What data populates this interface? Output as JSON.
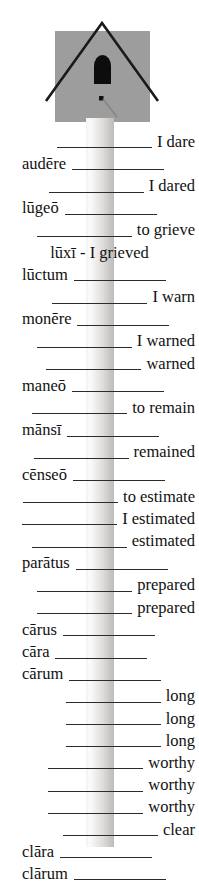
{
  "illustration": {
    "name": "birdhouse-on-post",
    "house_color": "#9d9d9d",
    "roof_line_color": "#1a1a1a",
    "hole_color": "#0d0d0d",
    "post_color": "#e8e7e5"
  },
  "worksheet": {
    "title": "Latin verb and adjective principal parts practice",
    "rows": [
      {
        "align": "right",
        "blank": true,
        "word": "",
        "answer": "I dare"
      },
      {
        "align": "left",
        "blank": true,
        "word": "audēre",
        "answer": ""
      },
      {
        "align": "right",
        "blank": true,
        "word": "",
        "answer": "I dared"
      },
      {
        "align": "left",
        "blank": true,
        "word": "lūgeō",
        "answer": ""
      },
      {
        "align": "right",
        "blank": true,
        "word": "",
        "answer": "to grieve"
      },
      {
        "align": "center",
        "blank": false,
        "word": "lūxī - I grieved",
        "answer": ""
      },
      {
        "align": "left",
        "blank": true,
        "word": "lūctum",
        "answer": ""
      },
      {
        "align": "right",
        "blank": true,
        "word": "",
        "answer": "I warn"
      },
      {
        "align": "left",
        "blank": true,
        "word": "monēre",
        "answer": ""
      },
      {
        "align": "right",
        "blank": true,
        "word": "",
        "answer": "I warned"
      },
      {
        "align": "right",
        "blank": true,
        "word": "",
        "answer": "warned"
      },
      {
        "align": "left",
        "blank": true,
        "word": "maneō",
        "answer": ""
      },
      {
        "align": "right",
        "blank": true,
        "word": "",
        "answer": "to remain"
      },
      {
        "align": "left",
        "blank": true,
        "word": "mānsī",
        "answer": ""
      },
      {
        "align": "right",
        "blank": true,
        "word": "",
        "answer": "remained"
      },
      {
        "align": "left",
        "blank": true,
        "word": "cēnseō",
        "answer": ""
      },
      {
        "align": "right",
        "blank": true,
        "word": "",
        "answer": "to estimate"
      },
      {
        "align": "right",
        "blank": true,
        "word": "",
        "answer": "I estimated"
      },
      {
        "align": "right",
        "blank": true,
        "word": "",
        "answer": "estimated"
      },
      {
        "align": "left",
        "blank": true,
        "word": "parātus",
        "answer": ""
      },
      {
        "align": "right",
        "blank": true,
        "word": "",
        "answer": "prepared"
      },
      {
        "align": "right",
        "blank": true,
        "word": "",
        "answer": "prepared"
      },
      {
        "align": "left",
        "blank": true,
        "word": "cārus",
        "answer": ""
      },
      {
        "align": "left",
        "blank": true,
        "word": "cāra",
        "answer": ""
      },
      {
        "align": "left",
        "blank": true,
        "word": "cārum",
        "answer": ""
      },
      {
        "align": "right",
        "blank": true,
        "word": "",
        "answer": "long"
      },
      {
        "align": "right",
        "blank": true,
        "word": "",
        "answer": "long"
      },
      {
        "align": "right",
        "blank": true,
        "word": "",
        "answer": "long"
      },
      {
        "align": "right",
        "blank": true,
        "word": "",
        "answer": "worthy"
      },
      {
        "align": "right",
        "blank": true,
        "word": "",
        "answer": "worthy"
      },
      {
        "align": "right",
        "blank": true,
        "word": "",
        "answer": "worthy"
      },
      {
        "align": "right",
        "blank": true,
        "word": "",
        "answer": "clear"
      },
      {
        "align": "left",
        "blank": true,
        "word": "clāra",
        "answer": ""
      },
      {
        "align": "left",
        "blank": true,
        "word": "clārum",
        "answer": ""
      }
    ]
  }
}
